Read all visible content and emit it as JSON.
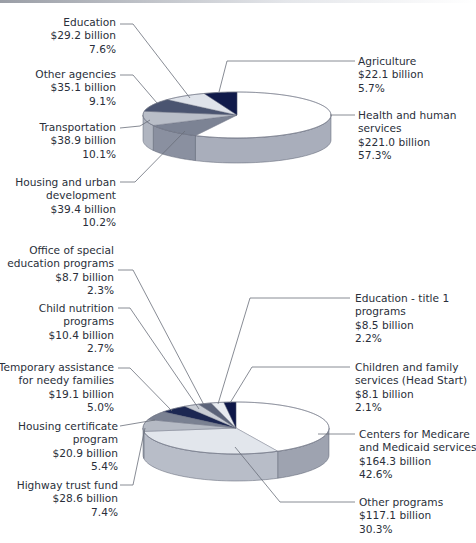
{
  "chart_data": [
    {
      "type": "pie",
      "title": "",
      "style": "3d",
      "categories": [
        "Health and human services",
        "Housing and urban development",
        "Transportation",
        "Other agencies",
        "Education",
        "Agriculture"
      ],
      "values_billion": [
        221.0,
        39.4,
        38.9,
        35.1,
        29.2,
        22.1
      ],
      "percent": [
        57.3,
        10.2,
        10.1,
        9.1,
        7.6,
        5.7
      ],
      "colors": [
        "#ffffff",
        "#7c8394",
        "#b9bec8",
        "#4a5470",
        "#dfe3ea",
        "#101a4a"
      ],
      "side_colors": [
        "#a9aebb",
        "#8a90a0",
        "#b0b5c0",
        "#8a90a0",
        "#a9aebb",
        "#a9aebb"
      ]
    },
    {
      "type": "pie",
      "title": "",
      "style": "3d",
      "categories": [
        "Centers for Medicare and Medicaid services",
        "Other programs",
        "Highway trust fund",
        "Housing certificate program",
        "Temporary assistance for needy families",
        "Child nutrition programs",
        "Office of special education programs",
        "Education - title 1 programs",
        "Children and family services (Head Start)"
      ],
      "values_billion": [
        164.3,
        117.1,
        28.6,
        20.9,
        19.1,
        10.4,
        8.7,
        8.5,
        8.1
      ],
      "percent": [
        42.6,
        30.3,
        7.4,
        5.4,
        5.0,
        2.7,
        2.3,
        2.2,
        2.1
      ],
      "colors": [
        "#ffffff",
        "#e2e6ec",
        "#b5bac4",
        "#7a8192",
        "#1c2752",
        "#c9cdd5",
        "#5b6379",
        "#e8ebf0",
        "#0e1748"
      ],
      "side_colors": [
        "#9ea3b0",
        "#b8bdc8",
        "#b0b5c0",
        "#8a90a0",
        "#8a90a0",
        "#a9aebb",
        "#a9aebb",
        "#a9aebb",
        "#a9aebb"
      ]
    }
  ],
  "labels": {
    "top": {
      "education": {
        "name": [
          "Education"
        ],
        "amount": "$29.2 billion",
        "pct": "7.6%"
      },
      "other_agencies": {
        "name": [
          "Other agencies"
        ],
        "amount": "$35.1 billion",
        "pct": "9.1%"
      },
      "transportation": {
        "name": [
          "Transportation"
        ],
        "amount": "$38.9 billion",
        "pct": "10.1%"
      },
      "housing": {
        "name": [
          "Housing and urban",
          "development"
        ],
        "amount": "$39.4 billion",
        "pct": "10.2%"
      },
      "agriculture": {
        "name": [
          "Agriculture"
        ],
        "amount": "$22.1 billion",
        "pct": "5.7%"
      },
      "health": {
        "name": [
          "Health and human",
          "services"
        ],
        "amount": "$221.0 billion",
        "pct": "57.3%"
      }
    },
    "bottom": {
      "special_ed": {
        "name": [
          "Office of special",
          "education programs"
        ],
        "amount": "$8.7 billion",
        "pct": "2.3%"
      },
      "child_nutrition": {
        "name": [
          "Child nutrition",
          "programs"
        ],
        "amount": "$10.4 billion",
        "pct": "2.7%"
      },
      "tanf": {
        "name": [
          "Temporary assistance",
          "for needy families"
        ],
        "amount": "$19.1 billion",
        "pct": "5.0%"
      },
      "housing_cert": {
        "name": [
          "Housing certificate",
          "program"
        ],
        "amount": "$20.9 billion",
        "pct": "5.4%"
      },
      "highway": {
        "name": [
          "Highway trust fund"
        ],
        "amount": "$28.6 billion",
        "pct": "7.4%"
      },
      "title1": {
        "name": [
          "Education - title 1",
          "programs"
        ],
        "amount": "$8.5 billion",
        "pct": "2.2%"
      },
      "head_start": {
        "name": [
          "Children and family",
          "services (Head Start)"
        ],
        "amount": "$8.1 billion",
        "pct": "2.1%"
      },
      "cms": {
        "name": [
          "Centers for Medicare",
          "and Medicaid services"
        ],
        "amount": "$164.3 billion",
        "pct": "42.6%"
      },
      "other_programs": {
        "name": [
          "Other programs"
        ],
        "amount": "$117.1 billion",
        "pct": "30.3%"
      }
    }
  }
}
